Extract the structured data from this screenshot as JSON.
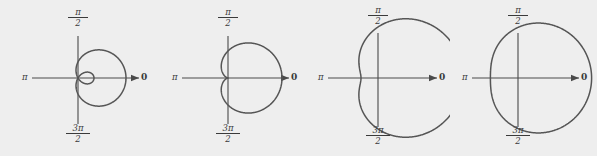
{
  "figure": {
    "name": "limacon-family-polar-plots",
    "background": "#eeeeee",
    "curve_color": "#555555",
    "axis_color": "#4a4a4a",
    "text_color": "#3a3a3a",
    "width": 597,
    "height": 156
  },
  "labels": {
    "pi": "π",
    "zero": "0",
    "half_pi_num": "π",
    "half_pi_den": "2",
    "three_half_pi_num": "3π",
    "three_half_pi_den": "2"
  },
  "chart_data": {
    "type": "line",
    "title": "",
    "xlabel": "",
    "ylabel": "",
    "coordinate_system": "polar",
    "family": "limaçon r = a + b cos θ",
    "panels": [
      {
        "index": 1,
        "name": "limacon-with-inner-loop",
        "classification": "limaçon with inner loop",
        "a_over_b": 0.5,
        "a": 1,
        "b": 2,
        "axis_labels": {
          "left": "π",
          "right": "0",
          "top_num": "π",
          "top_den": "2",
          "bottom_num": "3π",
          "bottom_den": "2"
        },
        "center": [
          78,
          78
        ],
        "scale": 16,
        "has_inner_loop": true,
        "has_dimple": false,
        "is_convex": false
      },
      {
        "index": 2,
        "name": "cardioid",
        "classification": "cardioid",
        "a_over_b": 1,
        "a": 1,
        "b": 1,
        "axis_labels": {
          "left": "π",
          "right": "0",
          "top_num": "π",
          "top_den": "2",
          "bottom_num": "3π",
          "bottom_den": "2"
        },
        "center": [
          228,
          78
        ],
        "scale": 27,
        "has_inner_loop": false,
        "has_dimple": false,
        "is_convex": false
      },
      {
        "index": 3,
        "name": "dimpled-limacon",
        "classification": "dimpled limaçon",
        "a_over_b": 1.5,
        "a": 3,
        "b": 2,
        "axis_labels": {
          "left": "π",
          "right": "0",
          "top_num": "π",
          "top_den": "2",
          "bottom_num": "3π",
          "bottom_den": "2"
        },
        "center": [
          378,
          78
        ],
        "scale": 17,
        "has_inner_loop": false,
        "has_dimple": true,
        "is_convex": false
      },
      {
        "index": 4,
        "name": "convex-limacon",
        "classification": "convex limaçon (oval)",
        "a_over_b": 2.2,
        "a": 2.2,
        "b": 1,
        "axis_labels": {
          "left": "π",
          "right": "0",
          "top_num": "π",
          "top_den": "2",
          "bottom_num": "3π",
          "bottom_den": "2"
        },
        "center": [
          518,
          78
        ],
        "scale": 23,
        "has_inner_loop": false,
        "has_dimple": false,
        "is_convex": true
      }
    ],
    "axis_ranges": {
      "theta": [
        0,
        6.283185307179586
      ]
    },
    "grid": false,
    "legend": "none"
  }
}
